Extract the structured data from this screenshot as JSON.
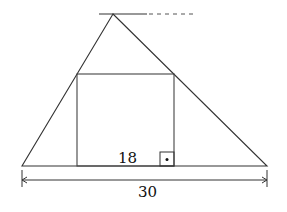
{
  "diagram": {
    "type": "geometry",
    "labels": {
      "square_side": "18",
      "base_length": "30"
    },
    "colors": {
      "line": "#333333",
      "background": "#ffffff"
    }
  }
}
